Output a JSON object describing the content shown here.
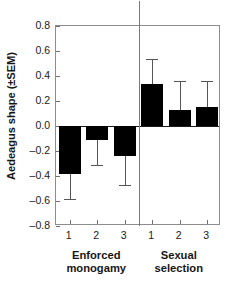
{
  "chart_data": {
    "type": "bar",
    "title": "",
    "xlabel": "",
    "ylabel": "Aedeagus shape (±SEM)",
    "ylim": [
      -0.8,
      0.8
    ],
    "grid": false,
    "legend": false,
    "y_ticks": [
      "0.8",
      "0.6",
      "0.4",
      "0.2",
      "0.0",
      "–0.2",
      "–0.4",
      "–0.6",
      "–0.8"
    ],
    "y_tick_values": [
      0.8,
      0.6,
      0.4,
      0.2,
      0.0,
      -0.2,
      -0.4,
      -0.6,
      -0.8
    ],
    "categories": [
      "1",
      "2",
      "3",
      "1",
      "2",
      "3"
    ],
    "values": [
      -0.385,
      -0.11,
      -0.24,
      0.34,
      0.13,
      0.155
    ],
    "errors": [
      0.195,
      0.2,
      0.23,
      0.2,
      0.23,
      0.21
    ],
    "error_low": [
      -0.58,
      -0.31,
      -0.47,
      0.34,
      0.13,
      0.155
    ],
    "error_high": [
      -0.385,
      -0.11,
      -0.24,
      0.54,
      0.36,
      0.36
    ],
    "bar_color": "#000000",
    "error_color": "#555555",
    "groups": [
      {
        "label_line1": "Enforced",
        "label_line2": "monogamy",
        "members": [
          "1",
          "2",
          "3"
        ]
      },
      {
        "label_line1": "Sexual",
        "label_line2": "selection",
        "members": [
          "1",
          "2",
          "3"
        ]
      }
    ],
    "group_divider": true,
    "annotations": []
  }
}
